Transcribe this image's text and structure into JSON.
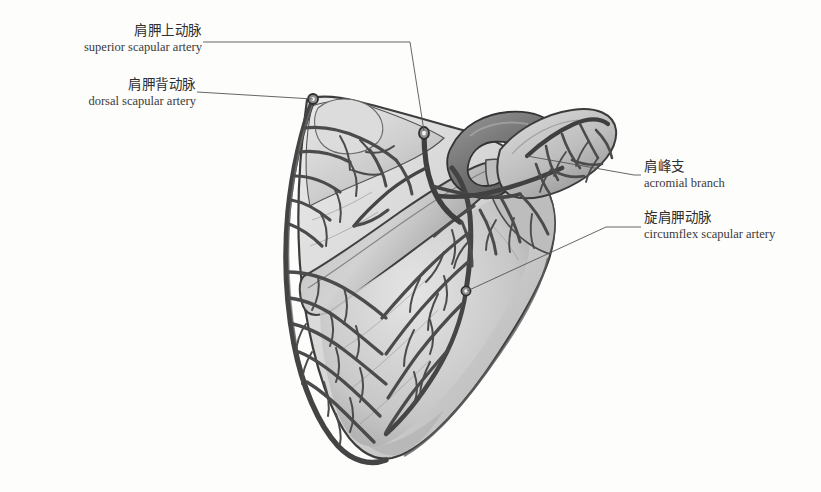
{
  "figure": {
    "title_semantic": "scapula-arterial-supply-illustration",
    "style": "grayscale pencil and wash medical illustration",
    "background_color": "#fdfdfc",
    "bone_fill_light": "#e3e3e3",
    "bone_fill_mid": "#c9c9c9",
    "bone_fill_dark": "#9d9d9d",
    "bone_outline_color": "#3d3d3d",
    "vessel_color": "#4b4b4b",
    "vessel_dark_color": "#3a3a3a",
    "leader_color": "#555555",
    "text_color": "#2f2f2f"
  },
  "labels": [
    {
      "id": "superior-scapular-artery",
      "cn": "肩胛上动脉",
      "en": "superior scapular artery",
      "align": "right",
      "block_left": 6,
      "block_top": 22,
      "block_width": 196
    },
    {
      "id": "dorsal-scapular-artery",
      "cn": "肩胛背动脉",
      "en": "dorsal scapular artery",
      "align": "right",
      "block_left": 6,
      "block_top": 76,
      "block_width": 190
    },
    {
      "id": "acromial-branch",
      "cn": "肩峰支",
      "en": "acromial branch",
      "align": "left",
      "block_left": 644,
      "block_top": 158,
      "block_width": 180
    },
    {
      "id": "circumflex-scapular-artery",
      "cn": "旋肩胛动脉",
      "en": "circumflex scapular artery",
      "align": "left",
      "block_left": 644,
      "block_top": 209,
      "block_width": 180
    }
  ],
  "leader_lines": [
    {
      "id": "leader-superior-scapular-artery",
      "points": "203,42 410,42 424,131"
    },
    {
      "id": "leader-dorsal-scapular-artery",
      "points": "197,92 313,99"
    },
    {
      "id": "leader-acromial-branch",
      "points": "527,156 634,175 641,175"
    },
    {
      "id": "leader-circumflex-scapular-artery",
      "points": "467,291 606,227 641,227"
    }
  ],
  "markers": [
    {
      "id": "vessel-stump-superior-scapular",
      "cx": 424,
      "cy": 133
    },
    {
      "id": "vessel-stump-dorsal-scapular",
      "cx": 313,
      "cy": 98
    },
    {
      "id": "vessel-stump-circumflex-scapular",
      "cx": 466,
      "cy": 291
    }
  ]
}
